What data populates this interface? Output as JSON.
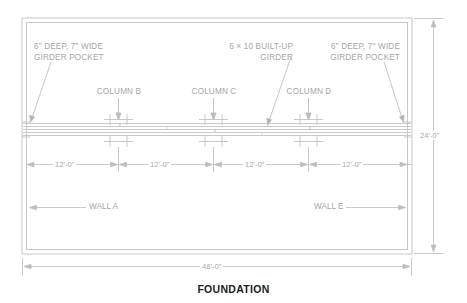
{
  "drawing": {
    "title": "FOUNDATION",
    "annotations": {
      "pocket_left": "6\" DEEP, 7\" WIDE\nGIRDER POCKET",
      "girder_center": "6 × 10 BUILT-UP\nGIRDER",
      "pocket_right": "6\" DEEP, 7\" WIDE\nGIRDER POCKET"
    },
    "columns": [
      {
        "label": "COLUMN B"
      },
      {
        "label": "COLUMN C"
      },
      {
        "label": "COLUMN D"
      }
    ],
    "bay_dimensions": [
      "12'-0\"",
      "12'-0\"",
      "12'-0\"",
      "12'-0\""
    ],
    "overall_width": "48'-0\"",
    "overall_height": "24'-0\"",
    "walls": {
      "left": "WALL A",
      "right": "WALL E"
    },
    "colors": {
      "line": "#cfcfcf",
      "line_dark": "#b4b4b4",
      "text": "#a6a6a6",
      "title": "#1c1c1c",
      "background": "#ffffff"
    }
  }
}
